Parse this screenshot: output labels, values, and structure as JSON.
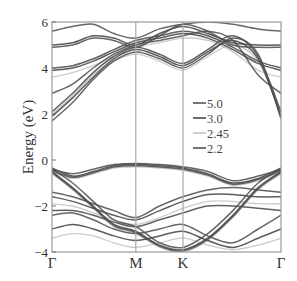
{
  "chart_data": {
    "type": "line",
    "title": "",
    "xlabel": "",
    "ylabel": "Energy (eV)",
    "ylim": [
      -4,
      6
    ],
    "yticks": [
      -4,
      -2,
      0,
      2,
      4,
      6
    ],
    "ytick_labels": [
      "-4",
      "-2",
      "0",
      "2",
      "4",
      "6"
    ],
    "k_path": [
      {
        "label": "Γ",
        "pos": 0.0
      },
      {
        "label": "M",
        "pos": 0.366
      },
      {
        "label": "K",
        "pos": 0.572
      },
      {
        "label": "Γ",
        "pos": 1.0
      }
    ],
    "grid": false,
    "legend_position": "inside-right-center",
    "legend": [
      {
        "label": "5.0",
        "color": "#555555"
      },
      {
        "label": "3.0",
        "color": "#4a4a4a"
      },
      {
        "label": "2.45",
        "color": "#c4c4c4"
      },
      {
        "label": "2.2",
        "color": "#505050"
      }
    ],
    "k_samples": [
      0.0,
      0.09,
      0.18,
      0.27,
      0.366,
      0.47,
      0.572,
      0.68,
      0.79,
      0.9,
      1.0
    ],
    "series": [
      {
        "name": "5.0",
        "color": "#555555",
        "bands": [
          [
            1.7,
            2.5,
            3.5,
            4.3,
            4.7,
            4.4,
            4.0,
            4.6,
            5.3,
            4.6,
            1.8
          ],
          [
            2.9,
            3.3,
            4.0,
            4.6,
            5.0,
            5.2,
            5.4,
            5.6,
            5.2,
            3.7,
            2.9
          ],
          [
            4.9,
            5.0,
            5.3,
            5.2,
            4.9,
            5.4,
            5.9,
            5.6,
            5.0,
            4.9,
            4.9
          ],
          [
            5.6,
            5.8,
            5.9,
            5.5,
            5.3,
            5.7,
            5.9,
            6.0,
            5.9,
            5.7,
            5.6
          ],
          [
            -0.4,
            -0.6,
            -0.4,
            -0.2,
            -0.15,
            -0.2,
            -0.3,
            -0.5,
            -0.9,
            -0.7,
            -0.4
          ],
          [
            -0.4,
            -1.0,
            -1.8,
            -2.6,
            -2.9,
            -3.6,
            -3.8,
            -3.2,
            -2.2,
            -1.0,
            -0.4
          ],
          [
            -1.4,
            -1.6,
            -1.9,
            -2.2,
            -2.5,
            -2.0,
            -1.6,
            -1.3,
            -1.2,
            -1.3,
            -1.4
          ],
          [
            -2.4,
            -2.3,
            -2.6,
            -3.0,
            -3.2,
            -3.0,
            -2.8,
            -3.3,
            -3.6,
            -3.0,
            -2.4
          ]
        ]
      },
      {
        "name": "3.0",
        "color": "#4a4a4a",
        "bands": [
          [
            1.9,
            2.7,
            3.6,
            4.4,
            4.8,
            4.5,
            4.1,
            4.7,
            5.2,
            4.4,
            1.9
          ],
          [
            3.9,
            4.0,
            4.3,
            4.7,
            5.1,
            5.3,
            5.5,
            5.3,
            4.8,
            4.2,
            3.9
          ],
          [
            5.0,
            5.1,
            5.4,
            5.3,
            5.0,
            5.5,
            5.8,
            5.5,
            5.1,
            5.0,
            5.0
          ],
          [
            -0.35,
            -0.7,
            -0.5,
            -0.25,
            -0.2,
            -0.25,
            -0.35,
            -0.6,
            -1.0,
            -0.8,
            -0.35
          ],
          [
            -0.5,
            -1.2,
            -2.0,
            -2.8,
            -3.1,
            -3.7,
            -3.9,
            -3.4,
            -2.4,
            -1.2,
            -0.5
          ],
          [
            -1.6,
            -1.8,
            -2.1,
            -2.4,
            -2.6,
            -2.2,
            -1.8,
            -1.5,
            -1.5,
            -1.6,
            -1.6
          ],
          [
            -3.0,
            -2.8,
            -3.0,
            -3.3,
            -3.5,
            -3.3,
            -3.1,
            -3.5,
            -3.8,
            -3.4,
            -3.0
          ]
        ]
      },
      {
        "name": "2.45",
        "color": "#c4c4c4",
        "bands": [
          [
            2.0,
            2.8,
            3.7,
            4.3,
            4.6,
            4.3,
            3.9,
            4.5,
            5.0,
            4.3,
            2.0
          ],
          [
            3.6,
            3.8,
            4.1,
            4.5,
            4.9,
            5.1,
            5.3,
            5.2,
            4.7,
            3.9,
            3.6
          ],
          [
            -0.5,
            -0.8,
            -0.6,
            -0.35,
            -0.3,
            -0.35,
            -0.45,
            -0.7,
            -1.1,
            -0.9,
            -0.5
          ],
          [
            -0.6,
            -1.3,
            -2.1,
            -2.9,
            -3.2,
            -3.8,
            -4.0,
            -3.5,
            -2.5,
            -1.3,
            -0.6
          ],
          [
            -1.9,
            -2.0,
            -2.3,
            -2.6,
            -2.8,
            -2.5,
            -2.1,
            -1.8,
            -1.8,
            -1.9,
            -1.9
          ],
          [
            -3.4,
            -3.2,
            -3.3,
            -3.6,
            -3.8,
            -3.6,
            -3.4,
            -3.7,
            -3.9,
            -3.7,
            -3.4
          ]
        ]
      },
      {
        "name": "2.2",
        "color": "#505050",
        "bands": [
          [
            2.1,
            2.9,
            3.8,
            4.5,
            4.9,
            4.6,
            4.2,
            4.8,
            5.4,
            4.5,
            2.1
          ],
          [
            4.0,
            4.1,
            4.4,
            4.8,
            5.2,
            5.4,
            5.6,
            5.4,
            4.9,
            4.3,
            4.0
          ],
          [
            -0.45,
            -0.75,
            -0.55,
            -0.3,
            -0.25,
            -0.3,
            -0.4,
            -0.65,
            -1.05,
            -0.85,
            -0.45
          ],
          [
            -0.55,
            -1.25,
            -2.05,
            -2.85,
            -3.15,
            -3.75,
            -3.95,
            -3.45,
            -2.45,
            -1.25,
            -0.55
          ],
          [
            -2.2,
            -2.2,
            -2.4,
            -2.7,
            -2.9,
            -2.6,
            -2.3,
            -2.0,
            -2.0,
            -2.1,
            -2.2
          ]
        ]
      }
    ]
  }
}
